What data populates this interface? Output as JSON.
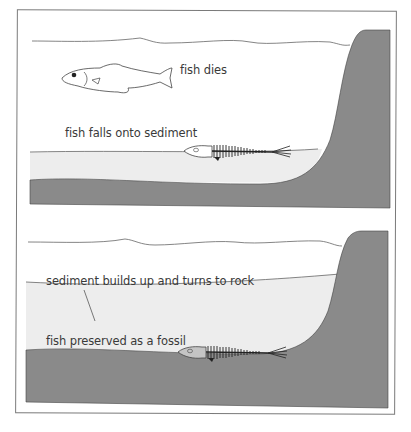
{
  "colors": {
    "rock": "#8a8a8a",
    "sediment": "#ededed",
    "water": "#ffffff",
    "line": "#555555",
    "text": "#3a3a3a"
  },
  "panels": [
    {
      "stage": 1,
      "labels": {
        "fish_dies": "fish dies",
        "fish_falls": "fish falls onto sediment"
      }
    },
    {
      "stage": 2,
      "labels": {
        "sediment_builds": "sediment builds up and turns to rock",
        "fish_preserved": "fish preserved as a fossil"
      }
    }
  ]
}
